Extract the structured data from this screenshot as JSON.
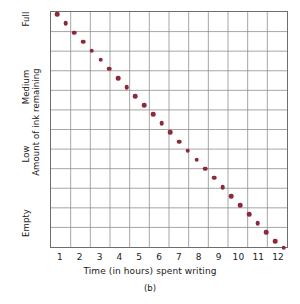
{
  "figure": {
    "caption": "(b)",
    "background_color": "#ffffff"
  },
  "chart_data": {
    "type": "scatter",
    "title": "",
    "xlabel": "Time (in hours) spent writing",
    "ylabel": "Amount of ink remaining",
    "xlim": [
      0,
      12
    ],
    "ylim": [
      0,
      12
    ],
    "grid": true,
    "legend": null,
    "marker_color": "#8b2a3a",
    "grid_color": "#8f8f8f",
    "axis_color": "#6d6d6d",
    "x_ticks": [
      "1",
      "2",
      "3",
      "4",
      "5",
      "6",
      "7",
      "8",
      "9",
      "10",
      "11",
      "12"
    ],
    "x_tick_values": [
      0.5,
      1.5,
      2.5,
      3.5,
      4.5,
      5.5,
      6.5,
      7.5,
      8.5,
      9.5,
      10.5,
      11.5
    ],
    "y_ticks": [
      "Full",
      "Medium",
      "Low",
      "Empty"
    ],
    "y_tick_values": [
      11.55,
      8.1,
      4.7,
      1.2
    ],
    "x_gridlines": 12,
    "y_gridlines": 12,
    "x": [
      0.3,
      0.74,
      1.18,
      1.62,
      2.06,
      2.5,
      2.94,
      3.38,
      3.82,
      4.26,
      4.7,
      5.14,
      5.58,
      6.02,
      6.46,
      6.9,
      7.34,
      7.78,
      8.22,
      8.66,
      9.1,
      9.54,
      9.98,
      10.42,
      10.86,
      11.3,
      11.74
    ],
    "y": [
      11.88,
      11.42,
      10.96,
      10.5,
      10.04,
      9.58,
      9.12,
      8.66,
      8.2,
      7.74,
      7.28,
      6.82,
      6.36,
      5.9,
      5.44,
      4.98,
      4.52,
      4.06,
      3.6,
      3.14,
      2.68,
      2.22,
      1.76,
      1.3,
      0.84,
      0.38,
      0.06
    ]
  }
}
